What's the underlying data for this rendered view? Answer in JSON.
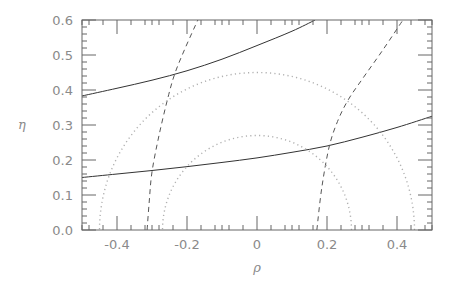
{
  "chart_data": {
    "type": "line",
    "title": "",
    "xlabel": "ρ",
    "ylabel": "η",
    "xlim": [
      -0.5,
      0.5
    ],
    "ylim": [
      0.0,
      0.6
    ],
    "grid": false,
    "legend": null,
    "x_ticks": [
      {
        "value": -0.4,
        "label": "-0.4"
      },
      {
        "value": -0.2,
        "label": "-0.2"
      },
      {
        "value": 0.0,
        "label": "0"
      },
      {
        "value": 0.2,
        "label": "0.2"
      },
      {
        "value": 0.4,
        "label": "0.4"
      }
    ],
    "y_ticks": [
      {
        "value": 0.0,
        "label": "0.0"
      },
      {
        "value": 0.1,
        "label": "0.1"
      },
      {
        "value": 0.2,
        "label": "0.2"
      },
      {
        "value": 0.3,
        "label": "0.3"
      },
      {
        "value": 0.4,
        "label": "0.4"
      },
      {
        "value": 0.5,
        "label": "0.5"
      },
      {
        "value": 0.6,
        "label": "0.6"
      }
    ],
    "series": [
      {
        "name": "upper-solid",
        "style": "solid",
        "color": "#333333",
        "points": [
          [
            -0.5,
            0.383
          ],
          [
            -0.4,
            0.405
          ],
          [
            -0.3,
            0.428
          ],
          [
            -0.2,
            0.455
          ],
          [
            -0.1,
            0.488
          ],
          [
            0.0,
            0.527
          ],
          [
            0.1,
            0.568
          ],
          [
            0.166,
            0.6
          ]
        ]
      },
      {
        "name": "lower-solid",
        "style": "solid",
        "color": "#333333",
        "points": [
          [
            -0.5,
            0.15
          ],
          [
            -0.4,
            0.16
          ],
          [
            -0.3,
            0.17
          ],
          [
            -0.2,
            0.181
          ],
          [
            -0.1,
            0.193
          ],
          [
            0.0,
            0.206
          ],
          [
            0.1,
            0.222
          ],
          [
            0.2,
            0.24
          ],
          [
            0.3,
            0.265
          ],
          [
            0.4,
            0.293
          ],
          [
            0.5,
            0.325
          ]
        ]
      },
      {
        "name": "left-dashed",
        "style": "dashed",
        "color": "#555555",
        "points": [
          [
            -0.314,
            0.0
          ],
          [
            -0.308,
            0.08
          ],
          [
            -0.3,
            0.166
          ],
          [
            -0.28,
            0.27
          ],
          [
            -0.254,
            0.38
          ],
          [
            -0.234,
            0.449
          ],
          [
            -0.205,
            0.52
          ],
          [
            -0.169,
            0.6
          ]
        ]
      },
      {
        "name": "right-dashed",
        "style": "dashed",
        "color": "#555555",
        "points": [
          [
            0.171,
            0.0
          ],
          [
            0.185,
            0.12
          ],
          [
            0.206,
            0.237
          ],
          [
            0.23,
            0.31
          ],
          [
            0.26,
            0.371
          ],
          [
            0.3,
            0.43
          ],
          [
            0.36,
            0.515
          ],
          [
            0.417,
            0.6
          ]
        ]
      },
      {
        "name": "inner-dotted-circle",
        "style": "dotted",
        "color": "#b0b0b0",
        "shape": "semicircle",
        "center": [
          0.0,
          0.0
        ],
        "radius": 0.27
      },
      {
        "name": "outer-dotted-circle",
        "style": "dotted",
        "color": "#b0b0b0",
        "shape": "semicircle",
        "center": [
          0.0,
          0.0
        ],
        "radius": 0.45
      }
    ]
  },
  "plot": {
    "frame": {
      "left": 82,
      "top": 20,
      "right": 432,
      "bottom": 230
    },
    "frame_color": "#666666",
    "text_color": "#8a8a8a"
  }
}
